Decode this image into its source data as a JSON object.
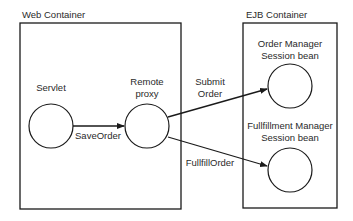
{
  "diagram": {
    "containers": [
      {
        "id": "web",
        "label": "Web Container"
      },
      {
        "id": "ejb",
        "label": "EJB Container"
      }
    ],
    "nodes": [
      {
        "id": "servlet",
        "label": "Servlet"
      },
      {
        "id": "remote_proxy",
        "label_line1": "Remote",
        "label_line2": "proxy"
      },
      {
        "id": "order_manager",
        "label_line1": "Order Manager",
        "label_line2": "Session bean"
      },
      {
        "id": "fulfillment_manager",
        "label_line1": "Fullfillment Manager",
        "label_line2": "Session bean"
      }
    ],
    "edges": [
      {
        "from": "servlet",
        "to": "remote_proxy",
        "label": "SaveOrder"
      },
      {
        "from": "remote_proxy",
        "to": "order_manager",
        "label_line1": "Submit",
        "label_line2": "Order"
      },
      {
        "from": "remote_proxy",
        "to": "fulfillment_manager",
        "label": "FullfillOrder"
      }
    ],
    "colors": {
      "stroke": "#1a1a1a",
      "text": "#2a2a2a",
      "background": "#ffffff"
    }
  }
}
